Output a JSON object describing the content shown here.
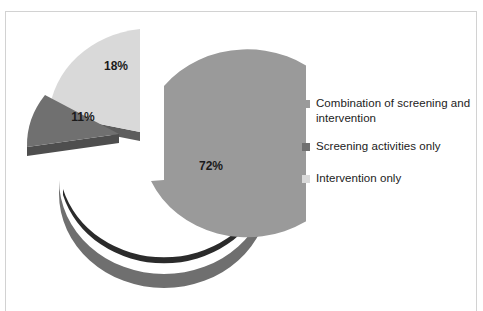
{
  "chart_data": {
    "type": "pie",
    "title": "",
    "categories": [
      "Combination of screening and intervention",
      "Screening activities only",
      "Intervention only"
    ],
    "values": [
      72,
      11,
      18
    ],
    "data_labels": [
      "72%",
      "11%",
      "18%"
    ],
    "colors": [
      "#9a9a9a",
      "#707070",
      "#d9d9d9"
    ],
    "legend_position": "right",
    "grid": false,
    "exploded": true,
    "three_d": true,
    "units": "percent",
    "xlabel": "",
    "ylabel": ""
  },
  "chart": {
    "title_partial": "",
    "frame_color": "#d2d2d2",
    "background": "#ffffff"
  },
  "slices": [
    {
      "name": "combination",
      "label": "72%",
      "value": 72,
      "color": "#9a9a9a",
      "side_color": "#6f6f6f",
      "label_x": 205,
      "label_y": 155
    },
    {
      "name": "screening-only",
      "label": "11%",
      "value": 11,
      "color": "#707070",
      "side_color": "#4e4e4e",
      "label_x": 77,
      "label_y": 106
    },
    {
      "name": "intervention-only",
      "label": "18%",
      "value": 18,
      "color": "#d9d9d9",
      "side_color": "#5d5d5d",
      "label_x": 110,
      "label_y": 55
    }
  ],
  "legend": {
    "items": [
      {
        "label": "Combination of screening and intervention",
        "color": "#9a9a9a",
        "swatch_name": "legend-swatch-combination"
      },
      {
        "label": "Screening activities only",
        "color": "#707070",
        "swatch_name": "legend-swatch-screening"
      },
      {
        "label": "Intervention only",
        "color": "#d9d9d9",
        "swatch_name": "legend-swatch-intervention"
      }
    ]
  }
}
